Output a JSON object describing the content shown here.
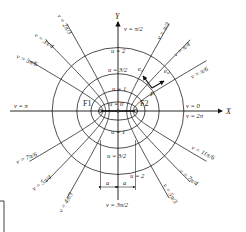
{
  "diagram": {
    "type": "elliptic-coordinates",
    "axes": {
      "x_label": "X",
      "y_label": "Y"
    },
    "foci": [
      {
        "label": "F1"
      },
      {
        "label": "F2"
      }
    ],
    "origin_label": "u = 0",
    "u_curves": [
      {
        "label": "u = 0",
        "value": 0
      },
      {
        "label": "u = 1",
        "value": 1
      },
      {
        "label": "u = 3/2",
        "value": 1.5
      },
      {
        "label": "u = 2",
        "value": 2
      }
    ],
    "u_labels_lower": [
      {
        "label": "u = 1"
      },
      {
        "label": "u = 3/2"
      },
      {
        "label": "u = 2"
      }
    ],
    "v_rays": [
      {
        "label": "v = 0",
        "label2": "v = 2π",
        "angle_deg": 0
      },
      {
        "label": "v = π/6",
        "angle_deg": 30
      },
      {
        "label": "v = π/4",
        "angle_deg": 45
      },
      {
        "label": "v = π/3",
        "angle_deg": 60
      },
      {
        "label": "v = π/2",
        "angle_deg": 90
      },
      {
        "label": "v = 2π/3",
        "angle_deg": 120
      },
      {
        "label": "v = 3π/4",
        "angle_deg": 135
      },
      {
        "label": "v = 5π/6",
        "angle_deg": 150
      },
      {
        "label": "v = π",
        "angle_deg": 180
      },
      {
        "label": "v = 7π/6",
        "angle_deg": 210
      },
      {
        "label": "v = 5π/4",
        "angle_deg": 225
      },
      {
        "label": "v = 4π/3",
        "angle_deg": 240
      },
      {
        "label": "v = 3π/2",
        "angle_deg": 270
      },
      {
        "label": "v = 5π/3",
        "angle_deg": 300
      },
      {
        "label": "v = 7π/4",
        "angle_deg": 315
      },
      {
        "label": "v = 11π/6",
        "angle_deg": 330
      }
    ],
    "point": {
      "label": "P",
      "unit_vectors": [
        "e_u",
        "e_v"
      ]
    },
    "dimension": {
      "left": "a",
      "right": "a"
    }
  }
}
